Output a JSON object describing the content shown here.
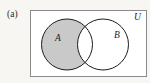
{
  "figure": {
    "panel_label": "(a)",
    "type": "venn-diagram",
    "shaded_region": "A minus B",
    "background_color": "#f7f6f3"
  },
  "universe": {
    "label": "U",
    "border_color": "#8a8a8a",
    "fill_color": "#ffffff",
    "rect": {
      "x": 30,
      "y": 10,
      "width": 117,
      "height": 67
    },
    "label_pos": {
      "x": 134,
      "y": 20
    }
  },
  "sets": [
    {
      "label": "A",
      "cx": 67,
      "cy": 44.5,
      "r": 25.5,
      "fill": "#c9c9c9",
      "stroke": "#1c1c1c",
      "shaded": true,
      "label_pos": {
        "x": 55,
        "y": 41
      }
    },
    {
      "label": "B",
      "cx": 103,
      "cy": 44.5,
      "r": 25.5,
      "fill": "#ffffff",
      "stroke": "#1c1c1c",
      "shaded": false,
      "label_pos": {
        "x": 114,
        "y": 38
      }
    }
  ],
  "intersection": {
    "label": "",
    "fill": "#ffffff",
    "shaded": false
  },
  "colors": {
    "shade_gray": "#c9c9c9",
    "outline_black": "#1c1c1c",
    "box_border": "#8a8a8a",
    "page_background": "#f7f6f3"
  }
}
